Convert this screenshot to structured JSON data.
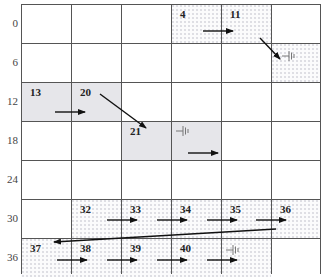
{
  "diagram": {
    "title": "",
    "grid": {
      "columns": 6,
      "rows": 7,
      "x_lines": [
        21,
        71,
        121,
        171,
        221,
        271,
        320
      ],
      "y_lines": [
        4,
        43,
        82,
        121,
        160,
        199,
        238,
        277
      ],
      "line_color": "#555555"
    },
    "y_axis_labels": [
      {
        "text": "0",
        "row": 0
      },
      {
        "text": "6",
        "row": 1
      },
      {
        "text": "12",
        "row": 2
      },
      {
        "text": "18",
        "row": 3
      },
      {
        "text": "24",
        "row": 4
      },
      {
        "text": "30",
        "row": 5
      },
      {
        "text": "36",
        "row": 6
      }
    ],
    "shaded_cells": [
      {
        "row": 2,
        "col": 0,
        "style": "grey"
      },
      {
        "row": 2,
        "col": 1,
        "style": "grey"
      },
      {
        "row": 3,
        "col": 2,
        "style": "grey"
      },
      {
        "row": 3,
        "col": 3,
        "style": "grey"
      },
      {
        "row": 0,
        "col": 3,
        "style": "dots"
      },
      {
        "row": 0,
        "col": 4,
        "style": "dots"
      },
      {
        "row": 1,
        "col": 5,
        "style": "dots"
      },
      {
        "row": 5,
        "col": 1,
        "style": "dots"
      },
      {
        "row": 5,
        "col": 2,
        "style": "dots"
      },
      {
        "row": 5,
        "col": 3,
        "style": "dots"
      },
      {
        "row": 5,
        "col": 4,
        "style": "dots"
      },
      {
        "row": 5,
        "col": 5,
        "style": "dots"
      },
      {
        "row": 6,
        "col": 0,
        "style": "dots"
      },
      {
        "row": 6,
        "col": 1,
        "style": "dots"
      },
      {
        "row": 6,
        "col": 2,
        "style": "dots"
      },
      {
        "row": 6,
        "col": 3,
        "style": "dots"
      },
      {
        "row": 6,
        "col": 4,
        "style": "dots"
      }
    ],
    "cell_numbers": [
      {
        "text": "4",
        "row": 0,
        "col": 3
      },
      {
        "text": "11",
        "row": 0,
        "col": 4
      },
      {
        "text": "13",
        "row": 2,
        "col": 0
      },
      {
        "text": "20",
        "row": 2,
        "col": 1
      },
      {
        "text": "21",
        "row": 3,
        "col": 2
      },
      {
        "text": "32",
        "row": 5,
        "col": 1
      },
      {
        "text": "33",
        "row": 5,
        "col": 2
      },
      {
        "text": "34",
        "row": 5,
        "col": 3
      },
      {
        "text": "35",
        "row": 5,
        "col": 4
      },
      {
        "text": "36",
        "row": 5,
        "col": 5
      },
      {
        "text": "37",
        "row": 6,
        "col": 0
      },
      {
        "text": "38",
        "row": 6,
        "col": 1
      },
      {
        "text": "39",
        "row": 6,
        "col": 2
      },
      {
        "text": "40",
        "row": 6,
        "col": 3
      }
    ],
    "arrows": [
      {
        "from": [
          203,
          31
        ],
        "to": [
          233,
          31
        ],
        "kind": "right"
      },
      {
        "from": [
          260,
          38
        ],
        "to": [
          280,
          59
        ],
        "kind": "diagonal"
      },
      {
        "from": [
          55,
          112
        ],
        "to": [
          85,
          112
        ],
        "kind": "right"
      },
      {
        "from": [
          100,
          94
        ],
        "to": [
          146,
          128
        ],
        "kind": "diagonal"
      },
      {
        "from": [
          188,
          153
        ],
        "to": [
          218,
          153
        ],
        "kind": "right"
      },
      {
        "from": [
          107,
          220
        ],
        "to": [
          137,
          220
        ],
        "kind": "right"
      },
      {
        "from": [
          157,
          220
        ],
        "to": [
          187,
          220
        ],
        "kind": "right"
      },
      {
        "from": [
          207,
          220
        ],
        "to": [
          237,
          220
        ],
        "kind": "right"
      },
      {
        "from": [
          256,
          220
        ],
        "to": [
          286,
          220
        ],
        "kind": "right"
      },
      {
        "from": [
          276,
          229
        ],
        "to": [
          54,
          242
        ],
        "kind": "return"
      },
      {
        "from": [
          57,
          260
        ],
        "to": [
          87,
          260
        ],
        "kind": "right"
      },
      {
        "from": [
          107,
          260
        ],
        "to": [
          137,
          260
        ],
        "kind": "right"
      },
      {
        "from": [
          157,
          260
        ],
        "to": [
          187,
          260
        ],
        "kind": "right"
      },
      {
        "from": [
          207,
          260
        ],
        "to": [
          237,
          260
        ],
        "kind": "right"
      }
    ],
    "ground_symbols": [
      {
        "x": 282,
        "y": 56
      },
      {
        "x": 176,
        "y": 131
      },
      {
        "x": 226,
        "y": 250
      }
    ],
    "colors": {
      "grey_fill": "#e6e6ea",
      "dot_fill": "#dcdce2",
      "arrow": "#111111",
      "text": "#222222"
    }
  }
}
